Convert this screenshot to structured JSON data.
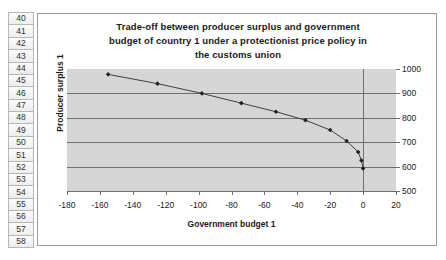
{
  "spreadsheet": {
    "row_headers": [
      "40",
      "41",
      "42",
      "43",
      "44",
      "45",
      "46",
      "47",
      "48",
      "49",
      "50",
      "51",
      "52",
      "53",
      "54",
      "55",
      "56",
      "57",
      "58"
    ]
  },
  "chart_data": {
    "type": "line",
    "title": "Trade-off between producer surplus and government budget of country 1 under a protectionist price policy in the customs union",
    "title_lines": [
      "Trade-off between producer surplus and government",
      "budget of country 1 under a protectionist price policy in",
      "the customs union"
    ],
    "xlabel": "Government budget 1",
    "ylabel": "Producer surplus 1",
    "xlim": [
      -180,
      20
    ],
    "ylim": [
      500,
      1000
    ],
    "xticks": [
      -180,
      -160,
      -140,
      -120,
      -100,
      -80,
      -60,
      -40,
      -20,
      0,
      20
    ],
    "yticks": [
      500,
      600,
      700,
      800,
      900,
      1000
    ],
    "xtick_labels": [
      "-180",
      "-160",
      "-140",
      "-120",
      "-100",
      "-80",
      "-60",
      "-40",
      "-20",
      "0",
      "20"
    ],
    "ytick_labels": [
      "500",
      "600",
      "700",
      "800",
      "900",
      "1000"
    ],
    "y_axis_position": "right",
    "grid": "horizontal",
    "gridlines_at": [
      600,
      700,
      800,
      900
    ],
    "legend": "none",
    "marker": "diamond",
    "series": [
      {
        "name": "Producer surplus 1",
        "x": [
          -155,
          -125,
          -98,
          -74,
          -53,
          -35,
          -20,
          -10,
          -3,
          -1,
          0
        ],
        "y": [
          978,
          940,
          900,
          860,
          825,
          790,
          750,
          705,
          660,
          625,
          592
        ]
      }
    ],
    "colors": {
      "plot_background": "#d6d6d6",
      "gridline": "#6f6f6f",
      "series_line": "#404040",
      "marker": "#202020",
      "frame_border": "#9a9a9a",
      "chart_background": "#ffffff",
      "text": "#1a1a1a"
    }
  }
}
